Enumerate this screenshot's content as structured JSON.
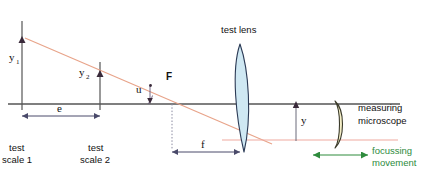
{
  "figure": {
    "background_color": "#ffffff"
  },
  "colors": {
    "ray": "#e8a48a",
    "axis": "#555555",
    "dimension": "#4a4a6a",
    "lens_test_fill": "#cfe8f3",
    "lens_test_stroke": "#2b3a55",
    "lens_micro_fill": "#f5efc8",
    "lens_micro_stroke": "#3a3a2a",
    "green": "#2e8b3d",
    "text": "#111111",
    "dotted": "#8a8aa0"
  },
  "labels": {
    "y1": "y",
    "y1_sub": "1",
    "y2": "y",
    "y2_sub": "2",
    "u": "u",
    "focal_point": "F",
    "e": "e",
    "f": "f",
    "y": "y",
    "test_scale_1_line1": "test",
    "test_scale_1_line2": "scale 1",
    "test_scale_2_line1": "test",
    "test_scale_2_line2": "scale 2",
    "test_lens": "test lens",
    "measuring_line1": "measuring",
    "measuring_line2": "microscope",
    "focussing_line1": "focussing",
    "focussing_line2": "movement"
  },
  "geometry": {
    "optical_axis_y": 104,
    "axis_x_start": 8,
    "axis_x_end": 400,
    "scale1_x": 22,
    "scale2_x": 100,
    "focal_point_x": 172,
    "lens_x": 240,
    "microscope_x": 341,
    "ray_start": {
      "x": 25,
      "y": 38
    },
    "ray_end": {
      "x": 272,
      "y": 144
    },
    "exit_ray_start": {
      "x": 240,
      "y": 140
    },
    "exit_ray_end": {
      "x": 398,
      "y": 140
    },
    "e_dimension_y": 116,
    "f_dimension_y": 152,
    "focussing_arrow_y": 155,
    "focussing_arrow_x1": 313,
    "focussing_arrow_x2": 368
  }
}
